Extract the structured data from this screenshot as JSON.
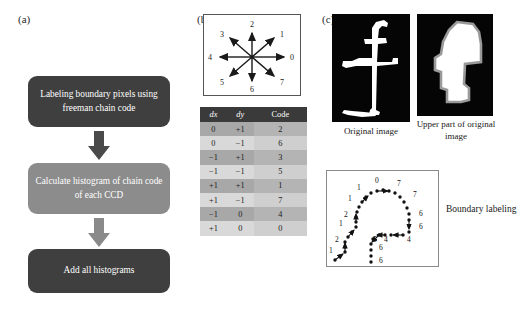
{
  "panels": {
    "a": {
      "label": "(a)"
    },
    "b": {
      "label": "(b)"
    },
    "c": {
      "label": "(c)"
    }
  },
  "flowchart": {
    "boxes": [
      {
        "id": "box1",
        "text": "Labeling boundary pixels using freeman chain code",
        "fill": "#3f3f3f",
        "text_color": "#ffffff"
      },
      {
        "id": "box2",
        "text": "Calculate histogram of chain code of each CCD",
        "fill": "#8c8c8c",
        "text_color": "#ffffff"
      },
      {
        "id": "box3",
        "text": "Add all histograms",
        "fill": "#3f3f3f",
        "text_color": "#ffffff"
      }
    ],
    "arrows": [
      {
        "id": "arrow1",
        "direction": "down",
        "fill": "#4a4a4a"
      },
      {
        "id": "arrow2",
        "direction": "down",
        "fill": "#7f7f7f"
      }
    ]
  },
  "chain_code_diagram": {
    "directions": [
      {
        "code": "0",
        "angle_deg": 0,
        "label_x": 88,
        "label_y": 45
      },
      {
        "code": "1",
        "angle_deg": 45,
        "label_x": 74,
        "label_y": 21
      },
      {
        "code": "2",
        "angle_deg": 90,
        "label_x": 48,
        "label_y": 11
      },
      {
        "code": "3",
        "angle_deg": 135,
        "label_x": 20,
        "label_y": 21
      },
      {
        "code": "4",
        "angle_deg": 180,
        "label_x": 6,
        "label_y": 45
      },
      {
        "code": "5",
        "angle_deg": 225,
        "label_x": 20,
        "label_y": 70
      },
      {
        "code": "6",
        "angle_deg": 270,
        "label_x": 48,
        "label_y": 79
      },
      {
        "code": "7",
        "angle_deg": 315,
        "label_x": 74,
        "label_y": 70
      }
    ]
  },
  "chain_code_table": {
    "headers": [
      "dx",
      "dy",
      "Code"
    ],
    "rows": [
      {
        "dx": "0",
        "dy": "+1",
        "code": "2",
        "shade": "dark"
      },
      {
        "dx": "0",
        "dy": "−1",
        "code": "6",
        "shade": "light"
      },
      {
        "dx": "−1",
        "dy": "+1",
        "code": "3",
        "shade": "dark"
      },
      {
        "dx": "−1",
        "dy": "−1",
        "code": "5",
        "shade": "light"
      },
      {
        "dx": "+1",
        "dy": "+1",
        "code": "1",
        "shade": "dark"
      },
      {
        "dx": "+1",
        "dy": "−1",
        "code": "7",
        "shade": "light"
      },
      {
        "dx": "−1",
        "dy": "0",
        "code": "4",
        "shade": "dark"
      },
      {
        "dx": "+1",
        "dy": "0",
        "code": "0",
        "shade": "light"
      }
    ]
  },
  "images": {
    "original": {
      "caption": "Original image",
      "background": "#050505",
      "shape_color": "#ffffff"
    },
    "upper": {
      "caption": "Upper part of original image",
      "background": "#050505",
      "shape_color": "#ffffff",
      "outline_color": "#9a9a9a"
    }
  },
  "boundary_labeling": {
    "caption": "Boundary labeling",
    "codes": [
      {
        "value": "0",
        "x": 50,
        "y": 11
      },
      {
        "value": "7",
        "x": 72,
        "y": 14
      },
      {
        "value": "1",
        "x": 31,
        "y": 18
      },
      {
        "value": "7",
        "x": 83,
        "y": 24
      },
      {
        "value": "1",
        "x": 22,
        "y": 28
      },
      {
        "value": "6",
        "x": 90,
        "y": 43
      },
      {
        "value": "2",
        "x": 18,
        "y": 44
      },
      {
        "value": "6",
        "x": 90,
        "y": 55
      },
      {
        "value": "1",
        "x": 13,
        "y": 53
      },
      {
        "value": "5",
        "x": 47,
        "y": 68
      },
      {
        "value": "4",
        "x": 58,
        "y": 68
      },
      {
        "value": "4",
        "x": 82,
        "y": 68
      },
      {
        "value": "2",
        "x": 9,
        "y": 69
      },
      {
        "value": "6",
        "x": 48,
        "y": 77
      },
      {
        "value": "1",
        "x": 3,
        "y": 80
      },
      {
        "value": "6",
        "x": 48,
        "y": 90
      }
    ]
  }
}
